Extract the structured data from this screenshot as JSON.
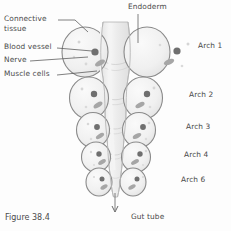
{
  "figure": {
    "caption": "Figure 38.4",
    "background_color": "#fdfdfd",
    "outline_color": "#8a8a8a",
    "fill_color": "#f0f0f0",
    "vessel_color": "#707070",
    "nerve_color": "#a8a8a8",
    "text_color": "#4a4a4a"
  },
  "labels": {
    "top": {
      "text": "Endoderm",
      "x": 128,
      "y": 4
    },
    "bottom": {
      "text": "Gut tube",
      "x": 131,
      "y": 215
    },
    "left": [
      {
        "text": "Connective",
        "x": 4,
        "y": 16
      },
      {
        "text": "tissue",
        "x": 4,
        "y": 26
      },
      {
        "text": "Blood vessel",
        "x": 4,
        "y": 44
      },
      {
        "text": "Nerve",
        "x": 4,
        "y": 57
      },
      {
        "text": "Muscle cells",
        "x": 4,
        "y": 71
      }
    ],
    "right": [
      {
        "text": "Arch 1",
        "x": 196,
        "y": 43
      },
      {
        "text": "Arch 2",
        "x": 189,
        "y": 92
      },
      {
        "text": "Arch 3",
        "x": 186,
        "y": 124
      },
      {
        "text": "Arch 4",
        "x": 184,
        "y": 152
      },
      {
        "text": "Arch 6",
        "x": 181,
        "y": 177
      }
    ]
  }
}
